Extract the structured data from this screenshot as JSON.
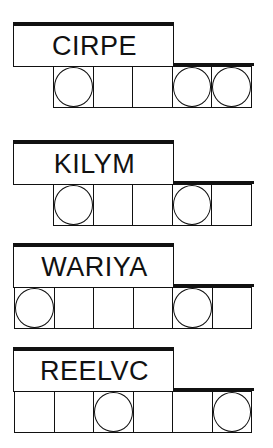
{
  "puzzles": [
    {
      "scrambled": "CIRPE",
      "cell_count": 5,
      "circled": [
        true,
        false,
        false,
        true,
        true
      ]
    },
    {
      "scrambled": "KILYM",
      "cell_count": 5,
      "circled": [
        true,
        false,
        false,
        true,
        false
      ]
    },
    {
      "scrambled": "WARIYA",
      "cell_count": 6,
      "circled": [
        true,
        false,
        false,
        false,
        true,
        false
      ]
    },
    {
      "scrambled": "REELVC",
      "cell_count": 6,
      "circled": [
        false,
        false,
        true,
        false,
        false,
        true
      ]
    }
  ],
  "colors": {
    "ink": "#111111",
    "background": "#ffffff"
  }
}
